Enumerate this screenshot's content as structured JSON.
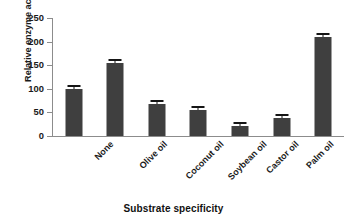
{
  "chart_data": {
    "type": "bar",
    "title": "",
    "xlabel": "Substrate specificity",
    "ylabel": "Relative enzyme activity (%)",
    "categories": [
      "None",
      "Olive oil",
      "Coconut oil",
      "Soybean oil",
      "Castor oil",
      "Palm oil",
      "Tributyrin"
    ],
    "values": [
      100,
      155,
      68,
      55,
      22,
      38,
      210
    ],
    "errors": [
      2,
      2,
      2,
      2,
      2,
      2,
      2
    ],
    "ylim": [
      0,
      250
    ],
    "yticks": [
      0,
      50,
      100,
      150,
      200,
      250
    ],
    "ytick_labels": [
      "0",
      "50",
      "100",
      "150",
      "200",
      "250"
    ],
    "grid": false,
    "legend": "none",
    "bar_color": "#3f3f3f",
    "axis_color": "#8c8c8c",
    "background": "#ffffff"
  }
}
